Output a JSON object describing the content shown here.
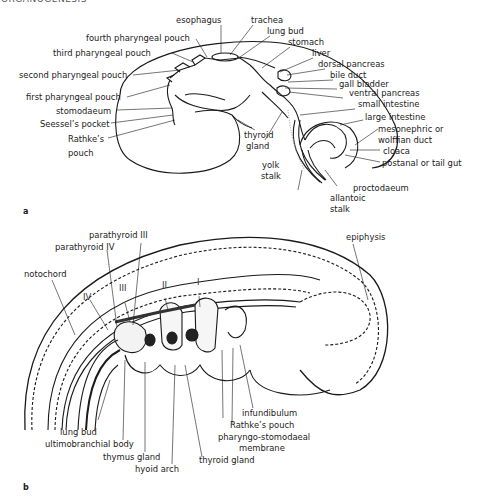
{
  "header": {
    "running_title": "ORGANOGENESIS"
  },
  "figure_a": {
    "panel_label": "a",
    "labels_left": [
      {
        "id": "esophagus",
        "text": "esophagus"
      },
      {
        "id": "fourth-pharyngeal-pouch",
        "text": "fourth pharyngeal pouch"
      },
      {
        "id": "third-pharyngeal-pouch",
        "text": "third pharyngeal pouch"
      },
      {
        "id": "second-pharyngeal-pouch",
        "text": "second pharyngeal pouch"
      },
      {
        "id": "first-pharyngeal-pouch",
        "text": "first pharyngeal pouch"
      },
      {
        "id": "stomodaeum",
        "text": "stomodaeum"
      },
      {
        "id": "seessels-pocket",
        "text": "Seessel’s pocket"
      },
      {
        "id": "rathkes-pouch-1",
        "text": "Rathke’s"
      },
      {
        "id": "rathkes-pouch-2",
        "text": "pouch"
      }
    ],
    "labels_right": [
      {
        "id": "trachea",
        "text": "trachea"
      },
      {
        "id": "lung-bud",
        "text": "lung bud"
      },
      {
        "id": "stomach",
        "text": "stomach"
      },
      {
        "id": "liver",
        "text": "liver"
      },
      {
        "id": "dorsal-pancreas",
        "text": "dorsal pancreas"
      },
      {
        "id": "bile-duct",
        "text": "bile duct"
      },
      {
        "id": "gall-bladder",
        "text": "gall bladder"
      },
      {
        "id": "ventral-pancreas",
        "text": "ventral pancreas"
      },
      {
        "id": "small-intestine",
        "text": "small intestine"
      },
      {
        "id": "large-intestine",
        "text": "large intestine"
      },
      {
        "id": "mesonephric-1",
        "text": "mesonephric or"
      },
      {
        "id": "mesonephric-2",
        "text": "wolffian duct"
      },
      {
        "id": "cloaca",
        "text": "cloaca"
      },
      {
        "id": "postanal",
        "text": "postanal or tail gut"
      }
    ],
    "labels_center": [
      {
        "id": "thyroid-1",
        "text": "thyroid"
      },
      {
        "id": "thyroid-2",
        "text": "gland"
      },
      {
        "id": "yolk-1",
        "text": "yolk"
      },
      {
        "id": "yolk-2",
        "text": "stalk"
      },
      {
        "id": "proctodaeum",
        "text": "proctodaeum"
      },
      {
        "id": "allantoic-1",
        "text": "allantoic"
      },
      {
        "id": "allantoic-2",
        "text": "stalk"
      }
    ]
  },
  "figure_b": {
    "panel_label": "b",
    "arch_numerals": [
      "IV",
      "III",
      "II",
      "I"
    ],
    "labels_top": [
      {
        "id": "parathyroid-iii",
        "text": "parathyroid III"
      },
      {
        "id": "parathyroid-iv",
        "text": "parathyroid IV"
      },
      {
        "id": "notochord",
        "text": "notochord"
      },
      {
        "id": "epiphysis",
        "text": "epiphysis"
      }
    ],
    "labels_bottom": [
      {
        "id": "lung-bud-b",
        "text": "lung bud"
      },
      {
        "id": "ultimobranchial-body",
        "text": "ultimobranchial body"
      },
      {
        "id": "thymus-gland",
        "text": "thymus gland"
      },
      {
        "id": "hyoid-arch",
        "text": "hyoid arch"
      },
      {
        "id": "thyroid-gland-b",
        "text": "thyroid gland"
      },
      {
        "id": "pharyngo-1",
        "text": "pharyngo-stomodaeal"
      },
      {
        "id": "pharyngo-2",
        "text": "membrane"
      },
      {
        "id": "rathkes-pouch-b",
        "text": "Rathke’s pouch"
      },
      {
        "id": "infundibulum",
        "text": "infundibulum"
      }
    ]
  }
}
